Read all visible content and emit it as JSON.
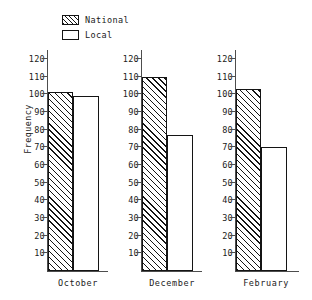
{
  "chart_data": {
    "type": "bar",
    "title": "",
    "xlabel": "",
    "ylabel": "Frequency",
    "categories": [
      "October",
      "December",
      "February"
    ],
    "series": [
      {
        "name": "National",
        "values": [
          101,
          110,
          103
        ]
      },
      {
        "name": "Local",
        "values": [
          99,
          77,
          70
        ]
      }
    ],
    "ylim": [
      0,
      125
    ],
    "yticks": [
      10,
      20,
      30,
      40,
      50,
      60,
      70,
      80,
      90,
      100,
      110,
      120
    ],
    "ytick_labels": [
      "10",
      "20",
      "30",
      "40",
      "50",
      "60",
      "70",
      "80",
      "90",
      "100",
      "110",
      "120"
    ],
    "grid": false,
    "legend_position": "top-left",
    "panels": "one y-axis per category group"
  },
  "legend": {
    "items": [
      {
        "label": "National",
        "swatch": "hatched-diagonal"
      },
      {
        "label": "Local",
        "swatch": "white-outline"
      }
    ]
  },
  "axes": {
    "y_title": "Frequency"
  },
  "colors": {
    "ink": "#141414",
    "axis": "#4d4d4d",
    "background": "#ffffff"
  }
}
